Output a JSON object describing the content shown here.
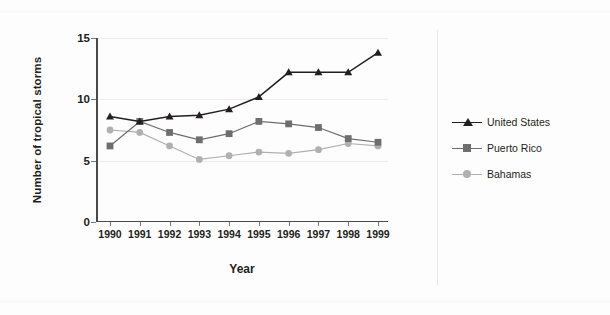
{
  "chart_data": {
    "type": "line",
    "title": "",
    "xlabel": "Year",
    "ylabel": "Number of tropical storms",
    "categories": [
      "1990",
      "1991",
      "1992",
      "1993",
      "1994",
      "1995",
      "1996",
      "1997",
      "1998",
      "1999"
    ],
    "x": [
      1990,
      1991,
      1992,
      1993,
      1994,
      1995,
      1996,
      1997,
      1998,
      1999
    ],
    "ylim": [
      0,
      15
    ],
    "yticks": [
      0,
      5,
      10,
      15
    ],
    "ytick_labels": [
      "0",
      "5",
      "10",
      "15"
    ],
    "grid": "horizontal",
    "legend_position": "right",
    "series": [
      {
        "name": "United States",
        "marker": "triangle",
        "color": "#231f20",
        "values": [
          8.6,
          8.2,
          8.6,
          8.7,
          9.2,
          10.2,
          12.2,
          12.2,
          12.2,
          13.8
        ]
      },
      {
        "name": "Puerto Rico",
        "marker": "square",
        "color": "#6e6e6e",
        "values": [
          6.2,
          8.2,
          7.3,
          6.7,
          7.2,
          8.2,
          8.0,
          7.7,
          6.8,
          6.5
        ]
      },
      {
        "name": "Bahamas",
        "marker": "circle",
        "color": "#b0b0b0",
        "values": [
          7.5,
          7.3,
          6.2,
          5.1,
          5.4,
          5.7,
          5.6,
          5.9,
          6.4,
          6.2
        ]
      }
    ]
  },
  "legend": {
    "items": [
      {
        "label": "United States"
      },
      {
        "label": "Puerto Rico"
      },
      {
        "label": "Bahamas"
      }
    ]
  },
  "colors": {
    "united_states": "#231f20",
    "puerto_rico": "#6e6e6e",
    "bahamas": "#b0b0b0",
    "axis": "#4a4a4a",
    "grid": "#ececec",
    "background": "#fdfdfd"
  }
}
